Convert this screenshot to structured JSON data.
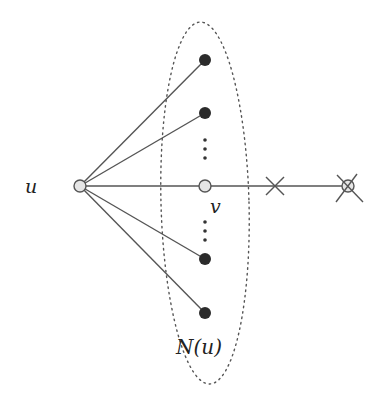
{
  "diagram": {
    "labels": {
      "u": "u",
      "v": "v",
      "neighborhood": "N(u)"
    },
    "colors": {
      "edge": "#555555",
      "filled_node": "#2b2b2b",
      "open_node_fill": "#e6e6e6",
      "open_node_stroke": "#555555",
      "ellipse": "#555555",
      "cross": "#555555"
    },
    "nodes": [
      {
        "id": "u",
        "type": "open",
        "x": 80,
        "y": 186
      },
      {
        "id": "n1",
        "type": "filled",
        "x": 205,
        "y": 60
      },
      {
        "id": "n2",
        "type": "filled",
        "x": 205,
        "y": 113
      },
      {
        "id": "v",
        "type": "open",
        "x": 205,
        "y": 186
      },
      {
        "id": "n3",
        "type": "filled",
        "x": 205,
        "y": 259
      },
      {
        "id": "n4",
        "type": "filled",
        "x": 205,
        "y": 313
      },
      {
        "id": "w",
        "type": "open-crossed",
        "x": 348,
        "y": 186
      }
    ],
    "edges": [
      [
        "u",
        "n1"
      ],
      [
        "u",
        "n2"
      ],
      [
        "u",
        "v"
      ],
      [
        "u",
        "n3"
      ],
      [
        "u",
        "n4"
      ],
      [
        "v",
        "w"
      ]
    ],
    "edge_cross_marker": {
      "x": 275,
      "y": 186
    },
    "ellipse": {
      "cx": 205,
      "cy": 203,
      "rx": 44,
      "ry": 181,
      "label": "N(u)"
    }
  }
}
